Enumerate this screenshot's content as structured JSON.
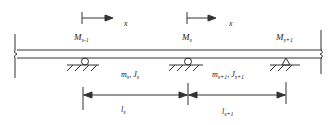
{
  "diagram": {
    "type": "continuous-beam",
    "colors": {
      "line": "#333333",
      "text": "#222222",
      "background": "#ffffff"
    },
    "axis_arrows": [
      {
        "label": "x",
        "at": "M_{s-1}"
      },
      {
        "label": "x",
        "at": "M_s"
      }
    ],
    "moments": [
      {
        "base": "M",
        "sub": "s-1"
      },
      {
        "base": "M",
        "sub": "s"
      },
      {
        "base": "M",
        "sub": "s+1"
      }
    ],
    "spans": [
      {
        "mass": "m",
        "mass_sub": "s",
        "sep": ", ",
        "inertia": "J",
        "inertia_sub": "s",
        "length": "l",
        "length_sub": "s"
      },
      {
        "mass": "m",
        "mass_sub": "s+1",
        "sep": ", ",
        "inertia": "J",
        "inertia_sub": "s+1",
        "length": "l",
        "length_sub": "s+1"
      }
    ],
    "supports": [
      {
        "kind": "pin-circle"
      },
      {
        "kind": "pin-circle"
      },
      {
        "kind": "pin-triangle"
      }
    ]
  }
}
